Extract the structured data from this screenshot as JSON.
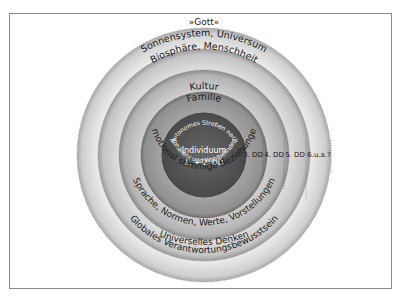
{
  "diagram": {
    "top_label": "»Gott«",
    "rings_top": [
      {
        "id": "sonnensystem",
        "label": "Sonnensystem, Universum"
      },
      {
        "id": "biosphaere",
        "label": "Biosphäre, Menschheit"
      },
      {
        "id": "kultur",
        "label": "Kultur"
      },
      {
        "id": "familie",
        "label": "Familie"
      }
    ],
    "core": {
      "title": "Individuum",
      "subtitle": "1. + 2. DD",
      "arc_top": "Autonomes Streben nach",
      "arc_bottom": "Kohärenz und Wohlbefinden"
    },
    "rings_bottom": [
      {
        "id": "emotional",
        "label": "Emotional stimmige Beziehungen"
      },
      {
        "id": "sprache",
        "label": "Sprache, Normen, Werte, Vorstellungen"
      },
      {
        "id": "global",
        "label": "Globales Verantwortungsbewusstsein"
      },
      {
        "id": "universell",
        "label": "Universelles Denken"
      }
    ],
    "dd_labels": [
      "3. DD",
      "4. DD",
      "5. DD",
      "6.u.a.?"
    ],
    "colors": {
      "core": "#5a5a5a",
      "ring1": "#8f8f8f",
      "ring2": "#b8b8b8",
      "ring3": "#d4d4d4",
      "ring4": "#e6e6e6",
      "frame": "#8a8a8a"
    }
  }
}
